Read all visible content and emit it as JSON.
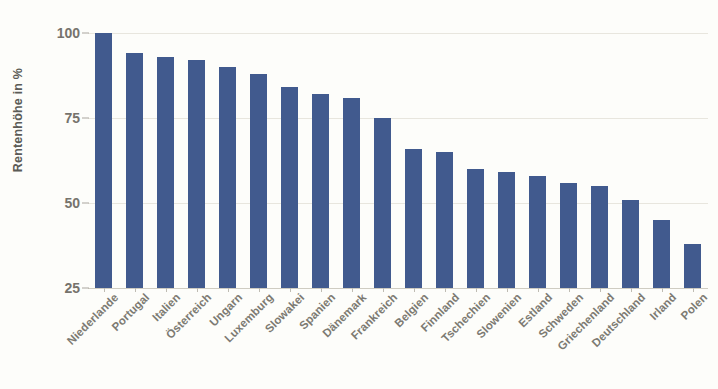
{
  "chart_data": {
    "type": "bar",
    "title": "",
    "subtitle": "",
    "xlabel": "",
    "ylabel": "Rentenhöhe in %",
    "ylim": [
      25,
      100
    ],
    "yticks": [
      25,
      50,
      75,
      100
    ],
    "ytick_labels": [
      "25",
      "50",
      "75",
      "100"
    ],
    "grid": true,
    "legend": false,
    "legend_position": "none",
    "bar_color": "#415a8e",
    "background_color": "#fdfdfa",
    "axis_label_color": "#76736c",
    "gridline_color": "#e8e6de",
    "categories": [
      "Niederlande",
      "Portugal",
      "Italien",
      "Österreich",
      "Ungarn",
      "Luxemburg",
      "Slowakei",
      "Spanien",
      "Dänemark",
      "Frankreich",
      "Belgien",
      "Finnland",
      "Tschechien",
      "Slowenien",
      "Estland",
      "Schweden",
      "Griechenland",
      "Deutschland",
      "Irland",
      "Polen"
    ],
    "values": [
      100,
      94,
      93,
      92,
      90,
      88,
      84,
      82,
      81,
      75,
      66,
      65,
      60,
      59,
      58,
      56,
      55,
      51,
      45,
      38
    ],
    "series": [
      {
        "name": "Rentenhöhe in %",
        "values": [
          100,
          94,
          93,
          92,
          90,
          88,
          84,
          82,
          81,
          75,
          66,
          65,
          60,
          59,
          58,
          56,
          55,
          51,
          45,
          38
        ]
      }
    ]
  }
}
